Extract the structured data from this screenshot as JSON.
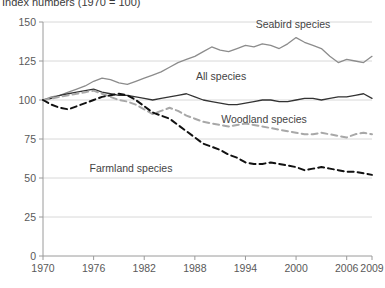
{
  "chart_data": {
    "type": "line",
    "title": "Index numbers (1970 = 100)",
    "xlabel": "",
    "ylabel": "",
    "xlim": [
      1970,
      2009
    ],
    "ylim": [
      0,
      150
    ],
    "grid": true,
    "legend_position": "inline-annotations",
    "yticks": [
      "0",
      "25",
      "50",
      "75",
      "100",
      "125",
      "150"
    ],
    "ytick_values": [
      0,
      25,
      50,
      75,
      100,
      125,
      150
    ],
    "xticks": [
      "1970",
      "1976",
      "1982",
      "1988",
      "1994",
      "2000",
      "2006",
      "2009"
    ],
    "xtick_values": [
      1970,
      1976,
      1982,
      1988,
      1994,
      2000,
      2006,
      2009
    ],
    "x": [
      1970,
      1971,
      1972,
      1973,
      1974,
      1975,
      1976,
      1977,
      1978,
      1979,
      1980,
      1981,
      1982,
      1983,
      1984,
      1985,
      1986,
      1987,
      1988,
      1989,
      1990,
      1991,
      1992,
      1993,
      1994,
      1995,
      1996,
      1997,
      1998,
      1999,
      2000,
      2001,
      2002,
      2003,
      2004,
      2005,
      2006,
      2007,
      2008,
      2009
    ],
    "series": [
      {
        "name": "Seabird species",
        "style": "solid",
        "color": "#8c8c8c",
        "label_text": "Seabird species",
        "values": [
          100,
          102,
          103,
          105,
          107,
          109,
          112,
          114,
          113,
          111,
          110,
          112,
          114,
          116,
          118,
          121,
          124,
          126,
          128,
          131,
          134,
          132,
          131,
          133,
          135,
          134,
          136,
          135,
          133,
          136,
          140,
          137,
          135,
          133,
          128,
          124,
          126,
          125,
          124,
          128
        ]
      },
      {
        "name": "All species",
        "style": "solid",
        "color": "#333333",
        "label_text": "All species",
        "values": [
          100,
          101,
          103,
          104,
          105,
          106,
          107,
          105,
          104,
          103,
          103,
          102,
          101,
          100,
          101,
          102,
          103,
          104,
          102,
          100,
          99,
          98,
          97,
          97,
          98,
          99,
          100,
          100,
          99,
          99,
          100,
          101,
          101,
          100,
          101,
          102,
          102,
          103,
          104,
          101
        ]
      },
      {
        "name": "Woodland species",
        "style": "dashed",
        "color": "#a8a8a8",
        "label_text": "Woodland species",
        "values": [
          100,
          101,
          102,
          103,
          104,
          105,
          106,
          104,
          102,
          100,
          99,
          97,
          94,
          91,
          93,
          95,
          93,
          90,
          88,
          86,
          85,
          84,
          83,
          84,
          85,
          84,
          83,
          82,
          81,
          80,
          79,
          78,
          78,
          79,
          78,
          77,
          76,
          78,
          79,
          78
        ]
      },
      {
        "name": "Farmland species",
        "style": "dashed",
        "color": "#111111",
        "label_text": "Farmland species",
        "values": [
          100,
          97,
          95,
          94,
          96,
          98,
          100,
          102,
          103,
          104,
          103,
          100,
          96,
          92,
          90,
          88,
          84,
          80,
          76,
          72,
          70,
          68,
          65,
          63,
          60,
          59,
          59,
          60,
          59,
          58,
          57,
          55,
          56,
          57,
          56,
          55,
          54,
          54,
          53,
          52
        ]
      }
    ]
  },
  "annotations": {
    "seabird": {
      "text": "Seabird species"
    },
    "all": {
      "text": "All species"
    },
    "woodland": {
      "text": "Woodland species"
    },
    "farmland": {
      "text": "Farmland species"
    }
  }
}
